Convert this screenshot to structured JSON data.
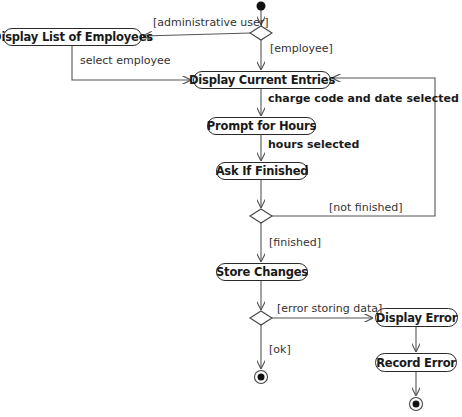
{
  "diagram": {
    "type": "UML activity diagram",
    "actions": [
      {
        "id": "display_list",
        "label": "Display List of Employees"
      },
      {
        "id": "display_current",
        "label": "Display Current Entries"
      },
      {
        "id": "prompt_hours",
        "label": "Prompt for Hours"
      },
      {
        "id": "ask_finished",
        "label": "Ask If Finished"
      },
      {
        "id": "store_changes",
        "label": "Store Changes"
      },
      {
        "id": "display_error",
        "label": "Display Error"
      },
      {
        "id": "record_error",
        "label": "Record Error"
      }
    ],
    "edge_labels": {
      "administrative_user": "[administrative user]",
      "employee": "[employee]",
      "select_employee": "select employee",
      "charge_code": "charge code and date selected",
      "hours_selected": "hours selected",
      "not_finished": "[not finished]",
      "finished": "[finished]",
      "error_storing": "[error storing data]",
      "ok": "[ok]"
    },
    "colors": {
      "line": "#555555",
      "node": "#111111"
    }
  }
}
